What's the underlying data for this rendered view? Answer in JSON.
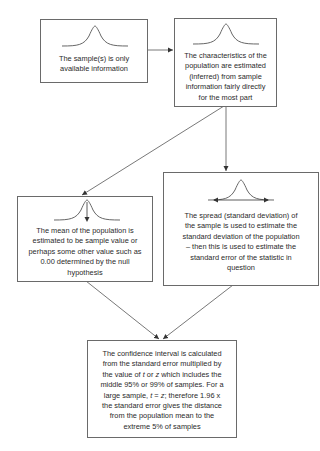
{
  "diagram": {
    "type": "flowchart",
    "nodes": [
      {
        "id": "sample",
        "text": "The sample(s) is only available information",
        "lines": [
          "The sample(s) is only",
          "available information"
        ],
        "icon": "normal-curve-icon"
      },
      {
        "id": "characteristics",
        "text": "The characteristics of the population are estimated (inferred) from sample information fairly directly for the most part",
        "lines": [
          "The characteristics of the",
          "population are estimated",
          "(inferred) from sample",
          "information fairly directly",
          "for the most part"
        ],
        "icon": "normal-curve-icon"
      },
      {
        "id": "mean",
        "text": "The mean of the population is estimated to be sample value or perhaps some other value such as 0.00 determined by the null hypothesis",
        "lines": [
          "The mean of the population is",
          "estimated to be sample value or",
          "perhaps some other value such as",
          "0.00 determined by the null",
          "hypothesis"
        ],
        "icon": "normal-curve-mean-arrow-icon"
      },
      {
        "id": "spread",
        "text": "The spread (standard deviation) of the sample is used to estimate the standard deviation of the population – then this is used to estimate the standard error of the statistic in question",
        "lines": [
          "The spread (standard deviation) of",
          "the sample is used to estimate the",
          "standard deviation of the population",
          "– then this is used to estimate the",
          "standard error of the statistic in",
          "question"
        ],
        "icon": "normal-curve-spread-arrow-icon"
      },
      {
        "id": "confidence",
        "text": "The confidence interval is calculated from the standard error multiplied by the value of t or z which includes the middle 95% or 99% of samples. For a large sample, t = z; therefore 1.96 x the standard error gives the distance from the population mean to the extreme 5% of samples",
        "lines": {
          "l1": "The confidence interval is calculated",
          "l2": "from the standard error multiplied by",
          "l3a": "the value of ",
          "l3t": "t",
          "l3b": " or ",
          "l3z": "z",
          "l3c": " which includes the",
          "l4": "middle 95% or 99% of samples. For a",
          "l5a": "large sample, ",
          "l5t": "t",
          "l5b": " = ",
          "l5z": "z",
          "l5c": "; therefore 1.96 x",
          "l6": "the standard error gives the distance",
          "l7": "from the population mean to the",
          "l8": "extreme 5% of samples"
        },
        "icon": null
      }
    ],
    "edges": [
      {
        "from": "sample",
        "to": "characteristics"
      },
      {
        "from": "characteristics",
        "to": "mean"
      },
      {
        "from": "characteristics",
        "to": "spread"
      },
      {
        "from": "mean",
        "to": "confidence"
      },
      {
        "from": "spread",
        "to": "confidence"
      }
    ]
  }
}
